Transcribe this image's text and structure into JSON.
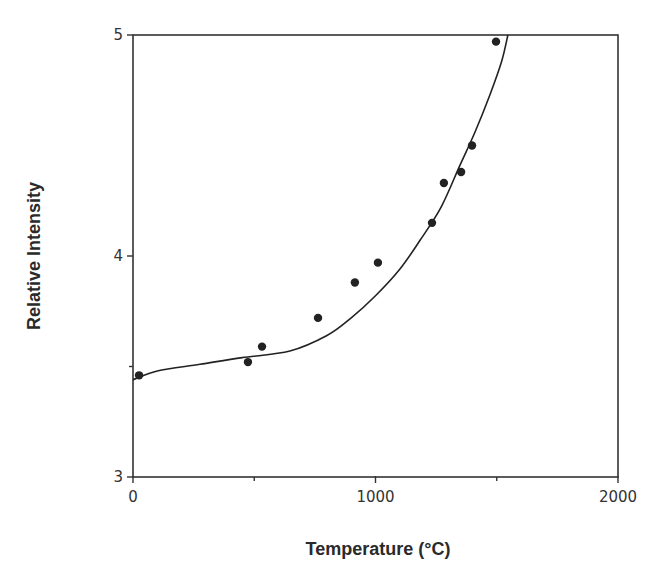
{
  "chart_data": {
    "type": "scatter",
    "title": "",
    "xlabel": "Temperature (°C)",
    "ylabel": "Relative Intensity",
    "xlim": [
      0,
      2000
    ],
    "ylim": [
      3,
      5
    ],
    "x_ticks": [
      0,
      1000,
      2000
    ],
    "x_minor_ticks": [
      500,
      1500
    ],
    "y_ticks": [
      3,
      4,
      5
    ],
    "y_minor_ticks": [
      3.5
    ],
    "x_tick_labels": [
      "0",
      "1000",
      "2000"
    ],
    "y_tick_labels": [
      "3",
      "4",
      "5"
    ],
    "grid": false,
    "legend": null,
    "series": [
      {
        "name": "measured",
        "kind": "scatter",
        "color": "#222222",
        "x": [
          25,
          474,
          532,
          763,
          915,
          1010,
          1233,
          1282,
          1353,
          1398,
          1497
        ],
        "y": [
          3.46,
          3.52,
          3.59,
          3.72,
          3.88,
          3.97,
          4.15,
          4.33,
          4.38,
          4.5,
          4.97
        ]
      },
      {
        "name": "fit",
        "kind": "line",
        "color": "#222222",
        "x": [
          0,
          100,
          276,
          450,
          647,
          800,
          900,
          1000,
          1100,
          1183,
          1270,
          1348,
          1410,
          1472,
          1520,
          1546
        ],
        "y": [
          3.44,
          3.48,
          3.51,
          3.54,
          3.57,
          3.64,
          3.72,
          3.82,
          3.94,
          4.07,
          4.22,
          4.41,
          4.56,
          4.73,
          4.88,
          5.0
        ]
      }
    ]
  }
}
